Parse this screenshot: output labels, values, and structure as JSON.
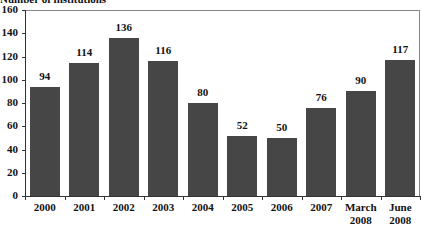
{
  "chart_data": {
    "type": "bar",
    "title": "Number of institutions",
    "xlabel": "",
    "ylabel": "Number of institutions",
    "ylim": [
      0,
      160
    ],
    "yticks": [
      0,
      20,
      40,
      60,
      80,
      100,
      120,
      140,
      160
    ],
    "grid": false,
    "legend": null,
    "categories": [
      "2000",
      "2001",
      "2002",
      "2003",
      "2004",
      "2005",
      "2006",
      "2007",
      "March 2008",
      "June 2008"
    ],
    "category_lines": [
      [
        "2000"
      ],
      [
        "2001"
      ],
      [
        "2002"
      ],
      [
        "2003"
      ],
      [
        "2004"
      ],
      [
        "2005"
      ],
      [
        "2006"
      ],
      [
        "2007"
      ],
      [
        "March",
        "2008"
      ],
      [
        "June",
        "2008"
      ]
    ],
    "values": [
      94,
      114,
      136,
      116,
      80,
      52,
      50,
      76,
      90,
      117
    ],
    "data_labels": [
      "94",
      "114",
      "136",
      "116",
      "80",
      "52",
      "50",
      "76",
      "90",
      "117"
    ],
    "bar_color": "#464646"
  }
}
